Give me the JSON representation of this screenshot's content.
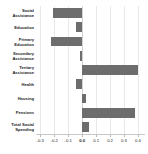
{
  "chart_data": {
    "type": "bar",
    "orientation": "horizontal",
    "title": "",
    "subtitle": "",
    "xlabel": "",
    "ylabel": "",
    "categories": [
      "Social Assistance",
      "Education",
      "Primary Education",
      "Secondary Assistance",
      "Tertiary Assistance",
      "Health",
      "Housing",
      "Pensions",
      "Total Social Spending"
    ],
    "category_lines": [
      [
        "Social",
        "Assistance"
      ],
      [
        "Education"
      ],
      [
        "Primary",
        "Education"
      ],
      [
        "Secondary",
        "Assistance"
      ],
      [
        "Tertiary",
        "Assistance"
      ],
      [
        "Health"
      ],
      [
        "Housing"
      ],
      [
        "Pensions"
      ],
      [
        "Total Social",
        "Spending"
      ]
    ],
    "values": [
      -0.205,
      -0.045,
      -0.22,
      -0.012,
      0.4,
      -0.045,
      0.03,
      0.38,
      0.05
    ],
    "xlim": [
      -0.33,
      0.45
    ],
    "xticks": [
      -0.3,
      -0.2,
      -0.1,
      0.0,
      0.1,
      0.2,
      0.3,
      0.4
    ],
    "xticklabels": [
      "-0.3",
      "-0.2",
      "-0.1",
      "0.0",
      "0.1",
      "0.2",
      "0.3",
      "0.4"
    ],
    "grid": true,
    "grid_axis": "x",
    "legend": null,
    "bar_color": "#6d6d6d",
    "zero_line": 0.0
  }
}
